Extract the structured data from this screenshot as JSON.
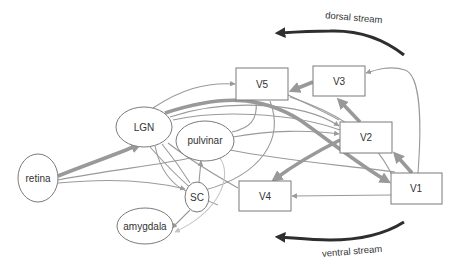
{
  "diagram": {
    "type": "visual-pathway-flow",
    "colors": {
      "node_stroke": "#7a7a7a",
      "edge": "#9a9a9a",
      "edge_light": "#c4c4c4",
      "edge_thick": "#999999",
      "stream_arrow": "#2e2e2e",
      "text": "#333333",
      "background": "#ffffff"
    },
    "nodes": {
      "retina": {
        "label": "retina",
        "shape": "ellipse"
      },
      "lgn": {
        "label": "LGN",
        "shape": "ellipse"
      },
      "pulvinar": {
        "label": "pulvinar",
        "shape": "ellipse"
      },
      "sc": {
        "label": "SC",
        "shape": "ellipse"
      },
      "amygdala": {
        "label": "amygdala",
        "shape": "ellipse"
      },
      "v1": {
        "label": "V1",
        "shape": "rect"
      },
      "v2": {
        "label": "V2",
        "shape": "rect"
      },
      "v3": {
        "label": "V3",
        "shape": "rect"
      },
      "v4": {
        "label": "V4",
        "shape": "rect"
      },
      "v5": {
        "label": "V5",
        "shape": "rect"
      }
    },
    "streams": {
      "dorsal": {
        "label": "dorsal stream",
        "direction": "right-to-left (top)"
      },
      "ventral": {
        "label": "ventral stream",
        "direction": "right-to-left (bottom)"
      }
    },
    "edges": [
      {
        "from": "retina",
        "to": "LGN",
        "weight": "thick"
      },
      {
        "from": "retina",
        "to": "SC",
        "weight": "thin"
      },
      {
        "from": "retina",
        "to": "pulvinar",
        "weight": "thin"
      },
      {
        "from": "LGN",
        "to": "V1",
        "weight": "thick"
      },
      {
        "from": "LGN",
        "to": "V5",
        "weight": "thin"
      },
      {
        "from": "LGN",
        "to": "V2",
        "weight": "thin"
      },
      {
        "from": "LGN",
        "to": "SC",
        "weight": "thin"
      },
      {
        "from": "pulvinar",
        "to": "V5",
        "weight": "thin"
      },
      {
        "from": "pulvinar",
        "to": "V2",
        "weight": "thin"
      },
      {
        "from": "pulvinar",
        "to": "amygdala",
        "weight": "light"
      },
      {
        "from": "pulvinar",
        "to": "V4",
        "weight": "thin"
      },
      {
        "from": "SC",
        "to": "pulvinar",
        "weight": "thin"
      },
      {
        "from": "SC",
        "to": "amygdala",
        "weight": "thin"
      },
      {
        "from": "SC",
        "to": "LGN",
        "weight": "thin"
      },
      {
        "from": "V1",
        "to": "V2",
        "weight": "thick"
      },
      {
        "from": "V1",
        "to": "V3",
        "weight": "thin"
      },
      {
        "from": "V1",
        "to": "V4",
        "weight": "thin"
      },
      {
        "from": "V1",
        "to": "pulvinar",
        "weight": "thin"
      },
      {
        "from": "V2",
        "to": "V3",
        "weight": "thick"
      },
      {
        "from": "V2",
        "to": "V4",
        "weight": "thick"
      },
      {
        "from": "V3",
        "to": "V5",
        "weight": "thick"
      },
      {
        "from": "V5",
        "to": "V1",
        "weight": "thin"
      },
      {
        "from": "V5",
        "to": "SC",
        "weight": "thin"
      }
    ]
  }
}
